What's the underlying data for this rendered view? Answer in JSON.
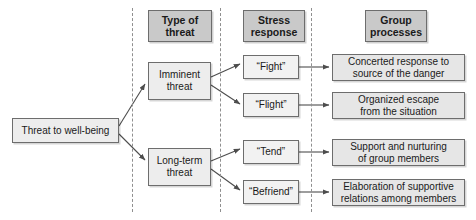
{
  "diagram": {
    "type": "flowchart",
    "colors": {
      "header_fill": "#c9c9c9",
      "node_fill": "#ededed",
      "process_fill": "#e6e6e6",
      "border": "#6d6d6d",
      "divider": "#8f8f8f",
      "arrow": "#4d4d4d",
      "text": "#1a1a1a",
      "background": "#ffffff"
    },
    "column_headers": [
      {
        "id": "type-of-threat",
        "label": "Type of\nthreat"
      },
      {
        "id": "stress-response",
        "label": "Stress\nresponse"
      },
      {
        "id": "group-processes",
        "label": "Group\nprocesses"
      }
    ],
    "root": {
      "id": "threat-to-well-being",
      "label": "Threat to well-being"
    },
    "threat_types": [
      {
        "id": "imminent-threat",
        "label": "Imminent\nthreat"
      },
      {
        "id": "long-term-threat",
        "label": "Long-term\nthreat"
      }
    ],
    "stress_responses": [
      {
        "id": "fight",
        "label": "“Fight”",
        "parent": "imminent-threat"
      },
      {
        "id": "flight",
        "label": "“Flight”",
        "parent": "imminent-threat"
      },
      {
        "id": "tend",
        "label": "“Tend”",
        "parent": "long-term-threat"
      },
      {
        "id": "befriend",
        "label": "“Befriend”",
        "parent": "long-term-threat"
      }
    ],
    "group_processes": [
      {
        "id": "concerted-response",
        "label": "Concerted response to\nsource of the danger",
        "parent": "fight"
      },
      {
        "id": "organized-escape",
        "label": "Organized escape\nfrom the situation",
        "parent": "flight"
      },
      {
        "id": "support-nurturing",
        "label": "Support and nurturing\nof group members",
        "parent": "tend"
      },
      {
        "id": "elaboration-supportive",
        "label": "Elaboration of supportive\nrelations among members",
        "parent": "befriend"
      }
    ],
    "dividers": [
      132,
      220,
      311
    ]
  }
}
